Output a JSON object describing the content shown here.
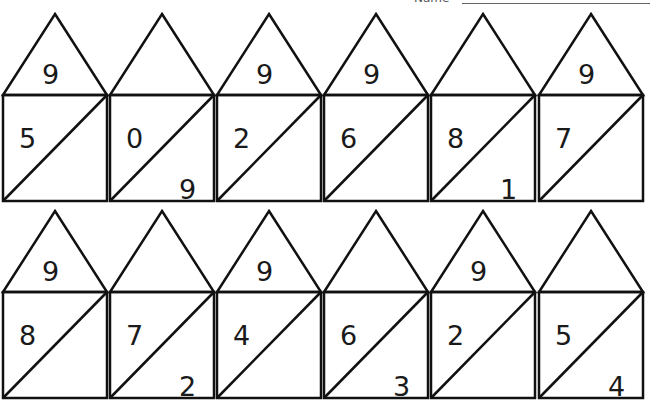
{
  "header": {
    "name_label": "Name",
    "name_value": ""
  },
  "rows": [
    {
      "houses": [
        {
          "roof": "9",
          "top": "5",
          "bottom": ""
        },
        {
          "roof": "",
          "top": "0",
          "bottom": "9"
        },
        {
          "roof": "9",
          "top": "2",
          "bottom": ""
        },
        {
          "roof": "9",
          "top": "6",
          "bottom": ""
        },
        {
          "roof": "",
          "top": "8",
          "bottom": "1"
        },
        {
          "roof": "9",
          "top": "7",
          "bottom": ""
        }
      ]
    },
    {
      "houses": [
        {
          "roof": "9",
          "top": "8",
          "bottom": ""
        },
        {
          "roof": "",
          "top": "7",
          "bottom": "2"
        },
        {
          "roof": "9",
          "top": "4",
          "bottom": ""
        },
        {
          "roof": "",
          "top": "6",
          "bottom": "3"
        },
        {
          "roof": "9",
          "top": "2",
          "bottom": ""
        },
        {
          "roof": "",
          "top": "5",
          "bottom": "4"
        }
      ]
    }
  ],
  "colors": {
    "line": "#111111",
    "background": "#ffffff"
  }
}
